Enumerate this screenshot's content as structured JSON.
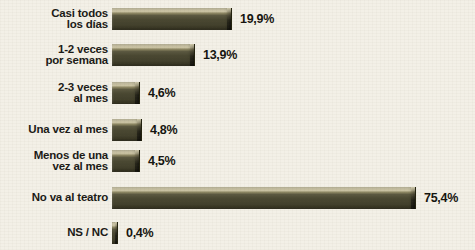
{
  "chart_data": {
    "type": "bar",
    "orientation": "horizontal",
    "title": "",
    "subtitle": "",
    "xlabel": "",
    "ylabel": "",
    "grid": false,
    "legend": null,
    "axis_note": "Last category bar is visually compressed; not drawn to the same linear scale as the others",
    "value_suffix": "%",
    "decimal_separator": ",",
    "categories": [
      "Casi todos\nlos días",
      "1-2 veces\npor semana",
      "2-3 veces\nal mes",
      "Una vez al mes",
      "Menos de una\nvez al mes",
      "No va al teatro",
      "NS / NC"
    ],
    "values": [
      19.9,
      13.9,
      4.6,
      4.8,
      4.5,
      75.4,
      0.4
    ],
    "value_labels": [
      "19,9%",
      "13,9%",
      "4,6%",
      "4,8%",
      "4,5%",
      "75,4%",
      "0,4%"
    ],
    "bar_pixel_widths": [
      119,
      82,
      27,
      29,
      27,
      303,
      5
    ],
    "xlim": [
      0,
      80
    ]
  },
  "style": {
    "background": "#f3f0e7",
    "bar_color": "#4b4a33",
    "bar_highlight": "#cac3a3",
    "text_color": "#15140f"
  },
  "rows": [
    {
      "label": "Casi todos\nlos días",
      "value_label": "19,9%",
      "bar_px": 119,
      "top": 4,
      "height": 30
    },
    {
      "label": "1-2 veces\npor semana",
      "value_label": "13,9%",
      "bar_px": 82,
      "top": 40,
      "height": 30
    },
    {
      "label": "2-3 veces\nal mes",
      "value_label": "4,6%",
      "bar_px": 27,
      "top": 78,
      "height": 30
    },
    {
      "label": "Una vez al mes",
      "value_label": "4,8%",
      "bar_px": 29,
      "top": 116,
      "height": 28
    },
    {
      "label": "Menos de una\nvez al mes",
      "value_label": "4,5%",
      "bar_px": 27,
      "top": 146,
      "height": 30
    },
    {
      "label": "No va al teatro",
      "value_label": "75,4%",
      "bar_px": 303,
      "top": 184,
      "height": 28
    },
    {
      "label": "NS / NC",
      "value_label": "0,4%",
      "bar_px": 5,
      "top": 220,
      "height": 26
    }
  ]
}
